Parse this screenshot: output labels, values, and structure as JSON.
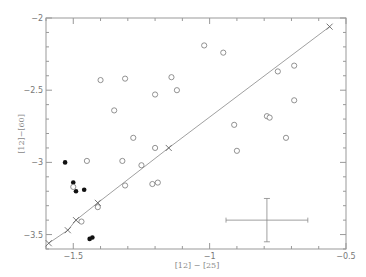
{
  "chart_data": {
    "type": "scatter",
    "title": "",
    "xlabel": "[12] − [25]",
    "ylabel": "[12]−[60]",
    "xlim": [
      -1.6,
      -0.5
    ],
    "ylim": [
      -3.6,
      -2.0
    ],
    "x_ticks": [
      -1.5,
      -1,
      -0.5
    ],
    "x_tick_labels": [
      "-1.5",
      "-1",
      "-0.5"
    ],
    "y_ticks": [
      -2,
      -2.5,
      -3,
      -3.5
    ],
    "y_tick_labels": [
      "-2",
      "-2.5",
      "-3",
      "-3.5"
    ],
    "grid": false,
    "legend": null,
    "series": [
      {
        "name": "filled",
        "marker": "filled-circle",
        "points": [
          [
            -1.53,
            -3.0
          ],
          [
            -1.5,
            -3.14
          ],
          [
            -1.49,
            -3.2
          ],
          [
            -1.46,
            -3.19
          ],
          [
            -1.44,
            -3.53
          ],
          [
            -1.43,
            -3.52
          ]
        ]
      },
      {
        "name": "open",
        "marker": "open-circle",
        "points": [
          [
            -1.45,
            -2.99
          ],
          [
            -1.5,
            -3.17
          ],
          [
            -1.41,
            -3.31
          ],
          [
            -1.47,
            -3.41
          ],
          [
            -1.4,
            -2.43
          ],
          [
            -1.31,
            -2.42
          ],
          [
            -1.14,
            -2.41
          ],
          [
            -1.2,
            -2.53
          ],
          [
            -1.12,
            -2.5
          ],
          [
            -1.35,
            -2.64
          ],
          [
            -1.28,
            -2.83
          ],
          [
            -1.2,
            -2.9
          ],
          [
            -1.32,
            -2.99
          ],
          [
            -1.25,
            -3.02
          ],
          [
            -1.31,
            -3.16
          ],
          [
            -1.21,
            -3.15
          ],
          [
            -1.19,
            -3.14
          ],
          [
            -1.02,
            -2.19
          ],
          [
            -0.95,
            -2.24
          ],
          [
            -0.75,
            -2.37
          ],
          [
            -0.69,
            -2.33
          ],
          [
            -0.69,
            -2.57
          ],
          [
            -0.79,
            -2.68
          ],
          [
            -0.78,
            -2.69
          ],
          [
            -0.91,
            -2.74
          ],
          [
            -0.72,
            -2.83
          ],
          [
            -0.9,
            -2.92
          ]
        ]
      },
      {
        "name": "model",
        "marker": "cross",
        "line": true,
        "points": [
          [
            -1.59,
            -3.56
          ],
          [
            -1.52,
            -3.47
          ],
          [
            -1.49,
            -3.4
          ],
          [
            -1.41,
            -3.28
          ],
          [
            -1.15,
            -2.9
          ],
          [
            -0.56,
            -2.06
          ]
        ]
      }
    ],
    "error_bar": {
      "x": -0.79,
      "y": -3.4,
      "xerr": [
        0.15,
        0.15
      ],
      "yerr": [
        0.15,
        0.15
      ]
    }
  },
  "style": {
    "axis_color": "#999999",
    "point_color": "#777777",
    "filled_color": "#111111",
    "line_color": "#888888"
  }
}
